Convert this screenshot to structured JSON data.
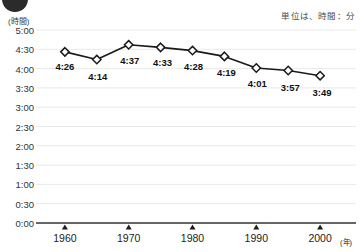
{
  "unit_note": "単位は、時間：分",
  "y_axis_caption": "(時間)",
  "x_axis_caption": "(年)",
  "colors": {
    "line": "#1a1a1a",
    "marker_fill": "#ffffff",
    "marker_stroke": "#1a1a1a",
    "gridline": "#e9e9e9",
    "baseline": "#333333",
    "text": "#1c1c1c",
    "badge": "#2b2b2b"
  },
  "chart_data": {
    "type": "line",
    "title": "",
    "subtitle": "",
    "xlabel": "(年)",
    "ylabel": "(時間)",
    "grid": true,
    "legend": "none",
    "xlim": [
      1955,
      2005
    ],
    "ylim": [
      0,
      5
    ],
    "ytick_labels": [
      "5:00",
      "4:30",
      "4:00",
      "3:30",
      "3:00",
      "2:30",
      "2:00",
      "1:30",
      "1:00",
      "0:30",
      "0:00"
    ],
    "ytick_values": [
      5.0,
      4.5,
      4.0,
      3.5,
      3.0,
      2.5,
      2.0,
      1.5,
      1.0,
      0.5,
      0.0
    ],
    "xtick_labels": [
      "1960",
      "1970",
      "1980",
      "1990",
      "2000"
    ],
    "xtick_values": [
      1960,
      1970,
      1980,
      1990,
      2000
    ],
    "x": [
      1960,
      1965,
      1970,
      1975,
      1980,
      1985,
      1990,
      1995,
      2000
    ],
    "point_labels": [
      "4:26",
      "4:14",
      "4:37",
      "4:33",
      "4:28",
      "4:19",
      "4:01",
      "3:57",
      "3:49"
    ],
    "values": [
      4.4333,
      4.2333,
      4.6167,
      4.55,
      4.4667,
      4.3167,
      4.0167,
      3.95,
      3.8167
    ]
  }
}
